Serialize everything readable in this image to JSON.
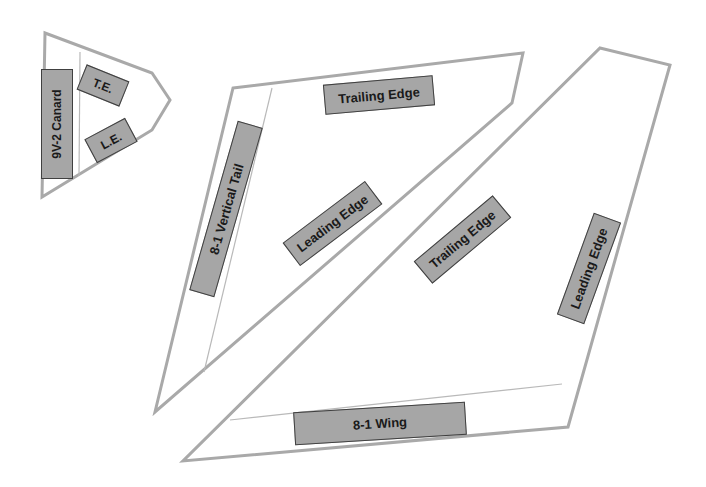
{
  "diagram": {
    "type": "aircraft component templates",
    "colors": {
      "outline": "#a9a9a9",
      "label_fill": "#a6a6a6",
      "label_border": "#404040",
      "label_text": "#1a1a1a"
    },
    "pieces": [
      {
        "id": "canard",
        "labels": {
          "name": "9V-2 Canard",
          "trailing": "T.E.",
          "leading": "L.E."
        }
      },
      {
        "id": "vertical_tail",
        "labels": {
          "name": "8-1 Vertical Tail",
          "trailing": "Trailing Edge",
          "leading": "Leading Edge"
        }
      },
      {
        "id": "wing",
        "labels": {
          "name": "8-1 Wing",
          "trailing": "Trailing Edge",
          "leading": "Leading Edge"
        }
      }
    ]
  }
}
